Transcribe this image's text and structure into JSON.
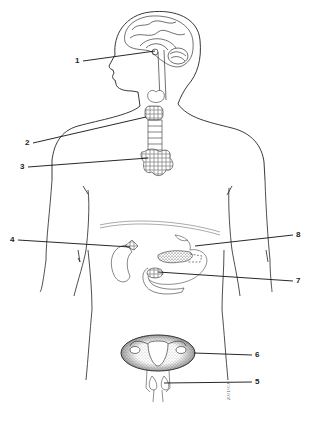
{
  "diagram": {
    "style": "black-and-white line drawing",
    "colors": {
      "background": "#ffffff",
      "line": "#222222",
      "stipple": "#333333"
    },
    "labels": [
      {
        "number": "1",
        "x": 78,
        "y": 57,
        "target": "pituitary gland / hypothalamus (brain base)"
      },
      {
        "number": "2",
        "x": 25,
        "y": 139,
        "target": "thyroid gland"
      },
      {
        "number": "3",
        "x": 20,
        "y": 163,
        "target": "thymus"
      },
      {
        "number": "4",
        "x": 10,
        "y": 237,
        "target": "adrenal gland (on kidney)"
      },
      {
        "number": "5",
        "x": 255,
        "y": 378,
        "target": "testes / ovaries region (lower)"
      },
      {
        "number": "6",
        "x": 255,
        "y": 352,
        "target": "ovaries (pelvis)"
      },
      {
        "number": "7",
        "x": 296,
        "y": 278,
        "target": "pancreas islets"
      },
      {
        "number": "8",
        "x": 296,
        "y": 232,
        "target": "stomach / pancreas"
      }
    ],
    "signature": "ZHUCK"
  }
}
